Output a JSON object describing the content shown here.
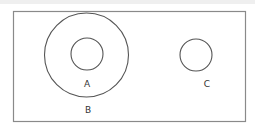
{
  "diagram": {
    "type": "venn",
    "stroke_color": "#555555",
    "border_color": "#8a8a8a",
    "universe": {
      "x": 13,
      "y": 11,
      "width": 232,
      "height": 110
    },
    "sets": [
      {
        "id": "B",
        "label": "B",
        "cx": 86.5,
        "cy": 55,
        "r": 42,
        "label_x": 88,
        "label_y": 113
      },
      {
        "id": "A",
        "label": "A",
        "cx": 87,
        "cy": 54,
        "r": 16,
        "label_x": 87,
        "label_y": 87
      },
      {
        "id": "C",
        "label": "C",
        "cx": 196,
        "cy": 55,
        "r": 16,
        "label_x": 207,
        "label_y": 87
      }
    ]
  },
  "labels": {
    "A": "A",
    "B": "B",
    "C": "C"
  }
}
